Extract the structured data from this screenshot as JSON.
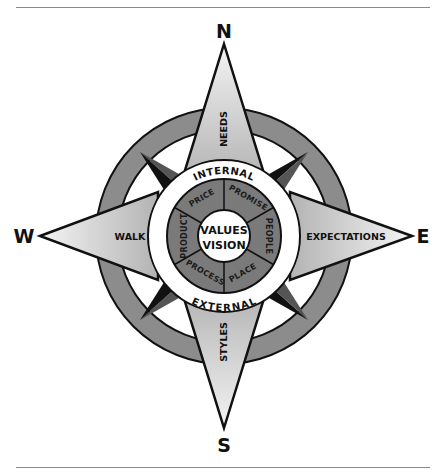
{
  "diagram": {
    "type": "compass-rose",
    "cardinals": {
      "north": "N",
      "east": "E",
      "south": "S",
      "west": "W"
    },
    "points": {
      "north": "NEEDS",
      "east": "EXPECTATIONS",
      "south": "STYLES",
      "west": "WALK"
    },
    "rings": {
      "top": "INTERNAL",
      "bottom": "EXTERNAL"
    },
    "segments": [
      "PRICE",
      "PROMISE",
      "PEOPLE",
      "PLACE",
      "PROCESS",
      "PRODUCT"
    ],
    "center": {
      "line1": "VALUES",
      "line2": "VISION"
    },
    "colors": {
      "outer_ring": "#8c8c8c",
      "segment_ring": "#7a7a7a",
      "point_fill_light": "#f2f2f2",
      "point_fill_dark": "#b8b8b8",
      "diagonal_dark": "#111111",
      "diagonal_mid": "#555555",
      "outline": "#111111"
    }
  }
}
